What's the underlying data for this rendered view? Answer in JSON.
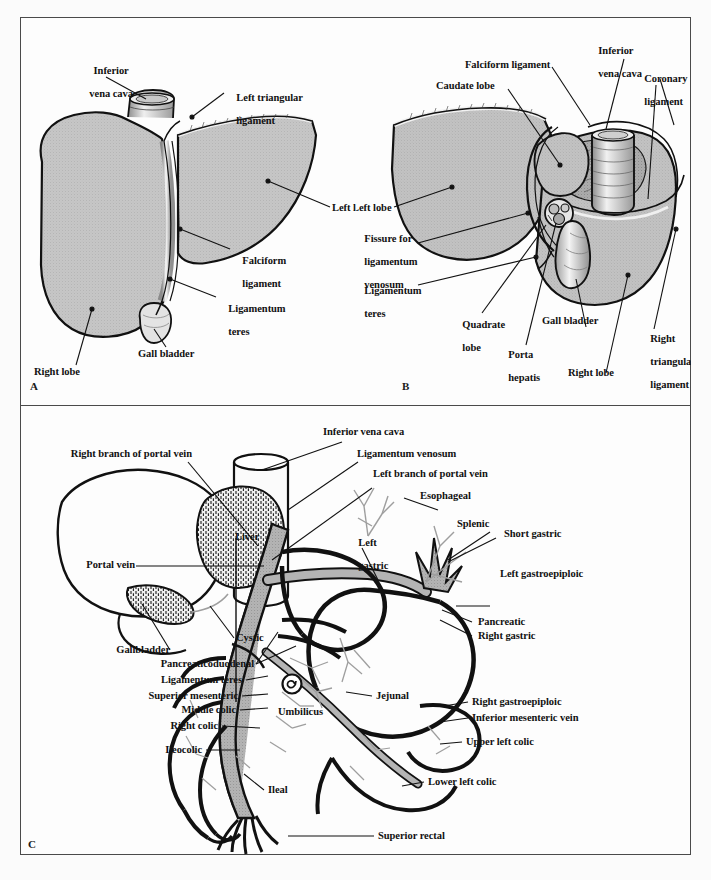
{
  "figure": {
    "panels": [
      {
        "id": "A",
        "letter": "A",
        "title": "Anterior view of the liver",
        "labels": [
          {
            "key": "inferior_vena_cava",
            "text": "Inferior\nvena cava"
          },
          {
            "key": "left_triangular_ligament",
            "text": "Left triangular\nligament"
          },
          {
            "key": "left_lobe",
            "text": "Left lobe"
          },
          {
            "key": "falciform_ligament",
            "text": "Falciform\nligament"
          },
          {
            "key": "ligamentum_teres",
            "text": "Ligamentum\nteres"
          },
          {
            "key": "gall_bladder",
            "text": "Gall bladder"
          },
          {
            "key": "right_lobe",
            "text": "Right lobe"
          }
        ]
      },
      {
        "id": "B",
        "letter": "B",
        "title": "Posterior / visceral view of the liver",
        "labels": [
          {
            "key": "falciform_ligament",
            "text": "Falciform ligament"
          },
          {
            "key": "caudate_lobe",
            "text": "Caudate lobe"
          },
          {
            "key": "inferior_vena_cava",
            "text": "Inferior\nvena cava"
          },
          {
            "key": "coronary_ligament",
            "text": "Coronary\nligament"
          },
          {
            "key": "left_lobe",
            "text": "Left lobe"
          },
          {
            "key": "fissure_for_ligamentum_venosum",
            "text": "Fissure for\nligamentum\nvenosum"
          },
          {
            "key": "ligamentum_teres",
            "text": "Ligamentum\nteres"
          },
          {
            "key": "quadrate_lobe",
            "text": "Quadrate\nlobe"
          },
          {
            "key": "porta_hepatis",
            "text": "Porta\nhepatis"
          },
          {
            "key": "gall_bladder",
            "text": "Gall bladder"
          },
          {
            "key": "right_lobe",
            "text": "Right lobe"
          },
          {
            "key": "right_triangular_ligament",
            "text": "Right\ntriangular\nligament"
          }
        ]
      },
      {
        "id": "C",
        "letter": "C",
        "title": "The portal venous system",
        "labels": [
          {
            "key": "inferior_vena_cava",
            "text": "Inferior vena cava"
          },
          {
            "key": "right_branch_portal_vein",
            "text": "Right branch of portal vein"
          },
          {
            "key": "ligamentum_venosum",
            "text": "Ligamentum venosum"
          },
          {
            "key": "left_branch_portal_vein",
            "text": "Left branch of portal vein"
          },
          {
            "key": "esophageal",
            "text": "Esophageal"
          },
          {
            "key": "liver",
            "text": "Liver"
          },
          {
            "key": "left_gastric",
            "text": "Left\ngastric"
          },
          {
            "key": "splenic",
            "text": "Splenic"
          },
          {
            "key": "short_gastric",
            "text": "Short gastric"
          },
          {
            "key": "portal_vein",
            "text": "Portal vein"
          },
          {
            "key": "left_gastroepiploic",
            "text": "Left gastroepiploic"
          },
          {
            "key": "cystic",
            "text": "Cystic"
          },
          {
            "key": "gallbladder",
            "text": "Gallbladder"
          },
          {
            "key": "pancreatic",
            "text": "Pancreatic"
          },
          {
            "key": "right_gastric",
            "text": "Right gastric"
          },
          {
            "key": "pancreaticoduodenal",
            "text": "Pancreaticoduodenal"
          },
          {
            "key": "ligamentum_teres",
            "text": "Ligamentum teres"
          },
          {
            "key": "superior_mesenteric",
            "text": "Superior mesenteric"
          },
          {
            "key": "middle_colic",
            "text": "Middle colic"
          },
          {
            "key": "jejunal",
            "text": "Jejunal"
          },
          {
            "key": "right_gastroepiploic",
            "text": "Right gastroepiploic"
          },
          {
            "key": "inferior_mesenteric_vein",
            "text": "Inferior mesenteric vein"
          },
          {
            "key": "right_colic",
            "text": "Right colic"
          },
          {
            "key": "umbilicus",
            "text": "Umbilicus"
          },
          {
            "key": "upper_left_colic",
            "text": "Upper left colic"
          },
          {
            "key": "ileocolic",
            "text": "Ileocolic"
          },
          {
            "key": "ileal",
            "text": "Ileal"
          },
          {
            "key": "lower_left_colic",
            "text": "Lower left colic"
          },
          {
            "key": "superior_rectal",
            "text": "Superior rectal"
          }
        ]
      }
    ]
  },
  "panel_a": {
    "letter": "A",
    "inferior_vena_cava_l1": "Inferior",
    "inferior_vena_cava_l2": "vena cava",
    "left_triangular_l1": "Left triangular",
    "left_triangular_l2": "ligament",
    "left_lobe": "Left lobe",
    "falciform_l1": "Falciform",
    "falciform_l2": "ligament",
    "ligamentum_teres_l1": "Ligamentum",
    "ligamentum_teres_l2": "teres",
    "gall_bladder": "Gall bladder",
    "right_lobe": "Right lobe"
  },
  "panel_b": {
    "letter": "B",
    "falciform_ligament": "Falciform ligament",
    "caudate_lobe": "Caudate lobe",
    "inferior_vena_cava_l1": "Inferior",
    "inferior_vena_cava_l2": "vena cava",
    "coronary_l1": "Coronary",
    "coronary_l2": "ligament",
    "left_lobe": "Left lobe",
    "fissure_l1": "Fissure for",
    "fissure_l2": "ligamentum",
    "fissure_l3": "venosum",
    "ligamentum_teres_l1": "Ligamentum",
    "ligamentum_teres_l2": "teres",
    "quadrate_l1": "Quadrate",
    "quadrate_l2": "lobe",
    "porta_l1": "Porta",
    "porta_l2": "hepatis",
    "gall_bladder": "Gall bladder",
    "right_lobe": "Right lobe",
    "right_triangular_l1": "Right",
    "right_triangular_l2": "triangular",
    "right_triangular_l3": "ligament"
  },
  "panel_c": {
    "letter": "C",
    "inferior_vena_cava": "Inferior vena cava",
    "right_branch_portal_vein": "Right branch of portal vein",
    "ligamentum_venosum": "Ligamentum venosum",
    "left_branch_portal_vein": "Left branch of portal vein",
    "esophageal": "Esophageal",
    "liver": "Liver",
    "left_gastric_l1": "Left",
    "left_gastric_l2": "gastric",
    "splenic": "Splenic",
    "short_gastric": "Short gastric",
    "portal_vein": "Portal vein",
    "left_gastroepiploic": "Left gastroepiploic",
    "cystic": "Cystic",
    "gallbladder": "Gallbladder",
    "pancreatic": "Pancreatic",
    "right_gastric": "Right gastric",
    "pancreaticoduodenal": "Pancreaticoduodenal",
    "ligamentum_teres": "Ligamentum teres",
    "superior_mesenteric": "Superior mesenteric",
    "middle_colic": "Middle colic",
    "jejunal": "Jejunal",
    "right_gastroepiploic": "Right gastroepiploic",
    "inferior_mesenteric_vein": "Inferior mesenteric vein",
    "right_colic": "Right colic",
    "umbilicus": "Umbilicus",
    "upper_left_colic": "Upper left colic",
    "ileocolic": "Ileocolic",
    "ileal": "Ileal",
    "lower_left_colic": "Lower left colic",
    "superior_rectal": "Superior rectal"
  },
  "colors": {
    "frame_border": "#4a4a4a",
    "page_background": "#fbfbfb",
    "panel_background": "#fdfdfd",
    "liver_fill": "#c4c4c4",
    "liver_fill_dark": "#a8a8a8",
    "liver_outline": "#111111",
    "vessel_fill": "#b0b0b0",
    "vessel_outline": "#111111",
    "text": "#111111",
    "leader_line": "#111111"
  }
}
